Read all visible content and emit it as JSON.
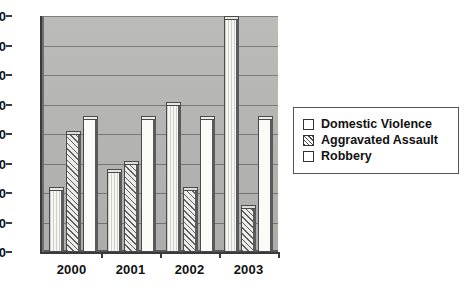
{
  "chart_data": {
    "type": "bar",
    "title": "",
    "xlabel": "",
    "ylabel": "",
    "categories": [
      "2000",
      "2001",
      "2002",
      "2003"
    ],
    "series": [
      {
        "name": "Domestic Violence",
        "values": [
          21,
          27,
          50,
          79
        ],
        "fill": "vertical-lines",
        "swatch": "open-square"
      },
      {
        "name": "Aggravated Assault",
        "values": [
          40,
          30,
          21,
          15
        ],
        "fill": "diagonal-hatch",
        "swatch": "hatched-square"
      },
      {
        "name": "Robbery",
        "values": [
          45,
          45,
          45,
          45
        ],
        "fill": "solid-white",
        "swatch": "open-square"
      }
    ],
    "ylim": [
      0,
      80
    ],
    "ytick_step": 10,
    "yticks": [
      "0",
      "10",
      "20",
      "30",
      "40",
      "50",
      "60",
      "70",
      "80"
    ],
    "grid": true,
    "legend_position": "right",
    "style": "3d-columns",
    "colors": {
      "plot_background": "#b6b6b4",
      "gridline": "#777777",
      "axis": "#3a3a3a",
      "bar_outline": "#4a4a4a",
      "text": "#111111",
      "page_background": "#ffffff"
    }
  },
  "legend": {
    "items": [
      {
        "label": "Domestic Violence"
      },
      {
        "label": "Aggravated Assault"
      },
      {
        "label": "Robbery"
      }
    ]
  }
}
